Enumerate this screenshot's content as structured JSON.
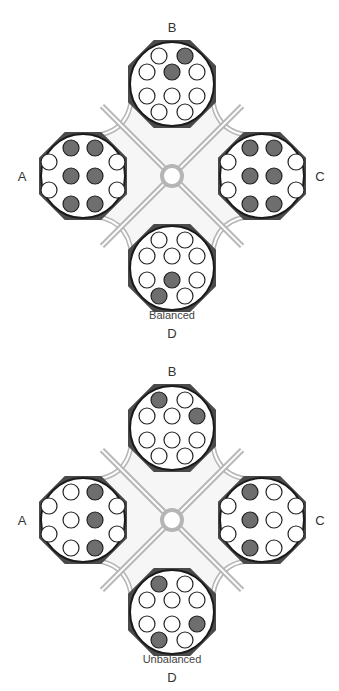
{
  "colors": {
    "pod_border": "#1a1a1a",
    "pod_corner": "#4a4a4a",
    "pod_fill": "#ffffff",
    "hole_filled": "#6e6e6e",
    "hole_empty": "#ffffff",
    "channel": "#b5b5b5",
    "frame_fill": "#f6f6f6"
  },
  "panels": [
    {
      "caption": "Balanced",
      "offset_y": 0,
      "pods": {
        "A": {
          "label": "A",
          "filled": [
            0,
            1,
            4,
            5,
            8,
            9
          ]
        },
        "B": {
          "label": "B",
          "filled": [
            1,
            3
          ]
        },
        "C": {
          "label": "C",
          "filled": [
            0,
            1,
            4,
            5,
            8,
            9
          ]
        },
        "D": {
          "label": "D",
          "filled": [
            6,
            8
          ]
        }
      }
    },
    {
      "caption": "Unbalanced",
      "offset_y": 344,
      "pods": {
        "A": {
          "label": "A",
          "filled": [
            1,
            5,
            9
          ]
        },
        "B": {
          "label": "B",
          "filled": [
            0,
            4
          ]
        },
        "C": {
          "label": "C",
          "filled": [
            0,
            4,
            8
          ]
        },
        "D": {
          "label": "D",
          "filled": [
            0,
            7,
            8
          ]
        }
      }
    }
  ]
}
